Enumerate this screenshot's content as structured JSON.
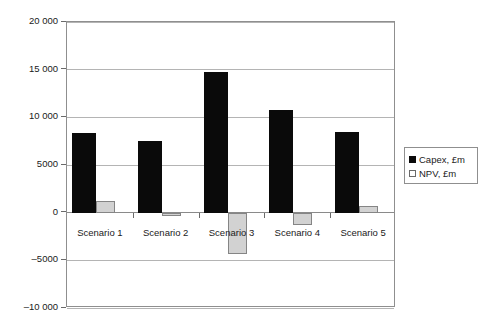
{
  "chart_data": {
    "type": "bar",
    "title": "",
    "subtitle": "",
    "xlabel": "",
    "ylabel": "",
    "categories": [
      "Scenario 1",
      "Scenario 2",
      "Scenario 3",
      "Scenario 4",
      "Scenario 5"
    ],
    "series": [
      {
        "name": "Capex, £m",
        "color": "#0a0a0a",
        "values": [
          8400,
          7500,
          14750,
          10800,
          8500
        ]
      },
      {
        "name": "NPV, £m",
        "color": "#d2d2d2",
        "values": [
          1200,
          -400,
          -4350,
          -1250,
          700
        ]
      }
    ],
    "ylim": [
      -10000,
      20000
    ],
    "ytick_values": [
      20000,
      15000,
      10000,
      5000,
      0,
      -5000,
      -10000
    ],
    "ytick_labels": [
      "20 000",
      "15 000",
      "10 000",
      "5000",
      "0",
      "–5000",
      "–10 000"
    ],
    "grid": true,
    "legend_position": "right"
  },
  "legend": {
    "items": [
      {
        "label": "Capex, £m",
        "swatch": "black-square"
      },
      {
        "label": "NPV, £m",
        "swatch": "white-square"
      }
    ]
  }
}
